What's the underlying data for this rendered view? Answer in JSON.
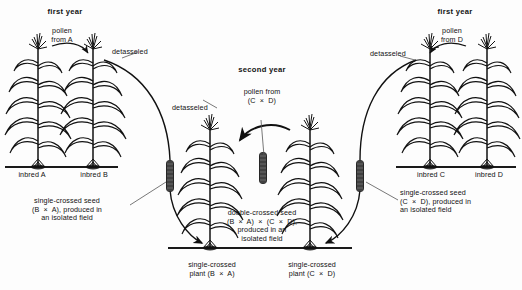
{
  "diagram": {
    "title_semantic": "hybrid-corn-double-cross-breeding-diagram",
    "symbols": {
      "times": "×"
    }
  },
  "panels": {
    "left": {
      "year_label": "first year",
      "pollen_label": "pollen\nfrom A",
      "detasseled_label": "detasseled",
      "plant_a_label": "inbred A",
      "plant_b_label": "inbred B",
      "seed_caption": "single-crossed seed\n(B  ×  A), produced in\nan isolated field"
    },
    "center": {
      "year_label": "second year",
      "pollen_label": "pollen from\n(C  ×  D)",
      "detasseled_label": "detasseled",
      "plant_left_label": "single-crossed\nplant (B  ×  A)",
      "plant_right_label": "single-crossed\nplant (C  ×  D)",
      "seed_caption": "double-crossed seed\n(B  ×  A)  ×  (C  ×  D),\nproduced in an\nisolated field"
    },
    "right": {
      "year_label": "first year",
      "pollen_label": "pollen\nfrom D",
      "detasseled_label": "detasseled",
      "plant_c_label": "inbred C",
      "plant_d_label": "inbred D",
      "seed_caption": "single-crossed seed\n(C  ×  D), produced in\nan isolated field"
    }
  },
  "colors": {
    "ink": "#111111",
    "ground": "#1a1a1a",
    "cob": "#262626",
    "background": "#fdfdfd"
  }
}
